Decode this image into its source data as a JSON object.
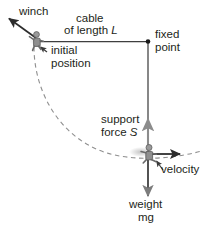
{
  "diagram": {
    "labels": {
      "winch": "winch",
      "cable_line1": "cable",
      "cable_line2_prefix": "of length ",
      "cable_line2_symbol": "L",
      "fixed_line1": "fixed",
      "fixed_line2": "point",
      "initial_line1": "initial",
      "initial_line2": "position",
      "support_line1": "support",
      "support_line2_prefix": "force ",
      "support_line2_symbol": "S",
      "velocity": "velocity",
      "weight_line1": "weight",
      "weight_line2": "mg"
    },
    "colors": {
      "ink": "#231f20",
      "cable": "#3f3f3f",
      "arc": "#8a8a8a",
      "force_arrow": "#8c8c8c",
      "figure_body": "#9a9a9a",
      "figure_outline": "#5a5a5a"
    },
    "geometry": {
      "fixed_point": {
        "x": 148,
        "y": 41
      },
      "initial_position": {
        "x": 37,
        "y": 41
      },
      "swing_position": {
        "x": 149,
        "y": 155
      },
      "winch_arrow_tip": {
        "x": 7,
        "y": 17
      },
      "cable_length_px": 114,
      "arc_label": "dashed swing path"
    },
    "vectors": [
      {
        "name": "support-force",
        "symbol": "S",
        "direction": "up"
      },
      {
        "name": "weight",
        "symbol": "mg",
        "direction": "down"
      },
      {
        "name": "velocity",
        "symbol": "v",
        "direction": "right"
      },
      {
        "name": "winch-pull",
        "symbol": "",
        "direction": "up-left"
      }
    ],
    "caption": ""
  }
}
